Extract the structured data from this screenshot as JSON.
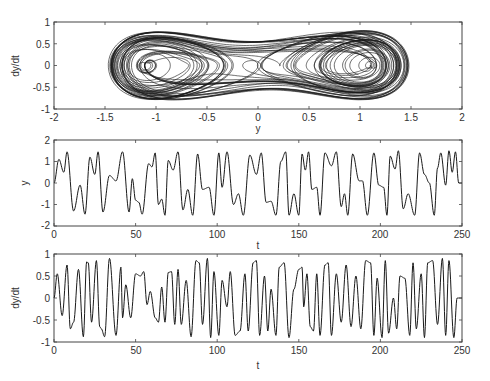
{
  "chart_data": [
    {
      "type": "line",
      "subtype": "phase-portrait",
      "title": "",
      "xlabel": "y",
      "ylabel": "dy/dt",
      "xlim": [
        -2,
        2
      ],
      "ylim": [
        -1,
        1
      ],
      "xticks": [
        -2,
        -1.5,
        -1,
        -0.5,
        0,
        0.5,
        1,
        1.5,
        2
      ],
      "yticks": [
        -1,
        -0.5,
        0,
        0.5,
        1
      ],
      "xtick_labels": [
        "-2",
        "-1.5",
        "-1",
        "-0.5",
        "0",
        "0.5",
        "1",
        "1.5",
        "2"
      ],
      "ytick_labels": [
        "-1",
        "-0.5",
        "0",
        "0.5",
        "1"
      ],
      "grid": false,
      "description": "Chaotic double-well attractor: trajectory of (y, dy/dt) orbiting two foci near y=-0.85 and y=0.85, outer envelope reaching y=±1.5, dy/dt within about ±0.9",
      "foci": [
        [
          -0.85,
          0.0
        ],
        [
          0.85,
          0.0
        ]
      ],
      "envelope": {
        "y_range": [
          -1.5,
          1.5
        ],
        "dydt_range": [
          -0.92,
          0.92
        ]
      }
    },
    {
      "type": "line",
      "title": "",
      "xlabel": "t",
      "ylabel": "y",
      "xlim": [
        0,
        250
      ],
      "ylim": [
        -2,
        2
      ],
      "xticks": [
        0,
        50,
        100,
        150,
        200,
        250
      ],
      "yticks": [
        -2,
        -1,
        0,
        1,
        2
      ],
      "xtick_labels": [
        "0",
        "50",
        "100",
        "150",
        "200",
        "250"
      ],
      "ytick_labels": [
        "-2",
        "-1",
        "0",
        "1",
        "2"
      ],
      "grid": false,
      "series": [
        {
          "name": "y(t)",
          "extrema_t": [
            0,
            3,
            6,
            8,
            12,
            16,
            19,
            22,
            25,
            27,
            30,
            34,
            38,
            42,
            46,
            48,
            50,
            52,
            54,
            58,
            60,
            62,
            64,
            66,
            68,
            70,
            73,
            76,
            79,
            82,
            85,
            88,
            91,
            95,
            98,
            101,
            103,
            106,
            110,
            113,
            116,
            120,
            124,
            127,
            130,
            133,
            136,
            139,
            142,
            144,
            147,
            150,
            152,
            154,
            156,
            158,
            161,
            163,
            166,
            170,
            173,
            176,
            178,
            180,
            183,
            187,
            189,
            192,
            196,
            199,
            202,
            204,
            206,
            209,
            211,
            214,
            217,
            221,
            224,
            227,
            230,
            233,
            235,
            237,
            240,
            242,
            244,
            246,
            248,
            250
          ],
          "extrema_y": [
            0.0,
            1.1,
            0.5,
            1.45,
            -1.3,
            -0.1,
            -1.45,
            1.2,
            0.4,
            1.45,
            -1.35,
            0.35,
            0.1,
            1.45,
            -1.35,
            0.2,
            -0.8,
            -0.9,
            -1.45,
            0.9,
            0.75,
            1.4,
            -1.0,
            -0.75,
            -1.5,
            1.05,
            0.6,
            1.45,
            -1.25,
            -0.3,
            -1.5,
            1.35,
            -0.3,
            -0.2,
            -1.5,
            1.4,
            -0.2,
            1.45,
            -1.0,
            -0.5,
            -1.5,
            1.3,
            0.4,
            1.4,
            -0.9,
            -0.85,
            -1.5,
            1.0,
            1.45,
            -1.5,
            -0.5,
            -1.5,
            1.35,
            0.6,
            1.45,
            -0.3,
            -0.2,
            -1.5,
            1.4,
            0.8,
            1.45,
            -1.1,
            -0.5,
            -1.5,
            1.35,
            0.1,
            0.1,
            -1.5,
            1.4,
            -0.1,
            -0.2,
            -1.5,
            1.25,
            0.65,
            1.5,
            -1.2,
            -0.5,
            -1.5,
            1.4,
            0.4,
            0.0,
            -1.5,
            0.7,
            1.4,
            -0.1,
            1.5,
            0.5,
            1.45,
            0.0,
            0.0
          ]
        }
      ]
    },
    {
      "type": "line",
      "title": "",
      "xlabel": "t",
      "ylabel": "dy/dt",
      "xlim": [
        0,
        250
      ],
      "ylim": [
        -1,
        1
      ],
      "xticks": [
        0,
        50,
        100,
        150,
        200,
        250
      ],
      "yticks": [
        -1,
        -0.5,
        0,
        0.5,
        1
      ],
      "xtick_labels": [
        "0",
        "50",
        "100",
        "150",
        "200",
        "250"
      ],
      "ytick_labels": [
        "-1",
        "-0.5",
        "0",
        "0.5",
        "1"
      ],
      "grid": false,
      "series": [
        {
          "name": "dy/dt(t)",
          "extrema_t": [
            0,
            2,
            5,
            8,
            10,
            12,
            15,
            18,
            20,
            21,
            23,
            26,
            28,
            29,
            31,
            34,
            38,
            41,
            42,
            44,
            47,
            50,
            53,
            55,
            57,
            59,
            62,
            64,
            66,
            68,
            70,
            72,
            74,
            76,
            78,
            81,
            84,
            87,
            89,
            91,
            94,
            96,
            98,
            101,
            103,
            106,
            108,
            111,
            114,
            117,
            119,
            122,
            124,
            126,
            129,
            131,
            133,
            136,
            138,
            141,
            144,
            147,
            150,
            152,
            153,
            155,
            157,
            159,
            161,
            163,
            166,
            168,
            170,
            173,
            176,
            179,
            182,
            185,
            188,
            191,
            194,
            196,
            198,
            201,
            203,
            205,
            208,
            210,
            212,
            215,
            218,
            220,
            222,
            225,
            227,
            229,
            232,
            235,
            238,
            240,
            242,
            245,
            247,
            249,
            250
          ],
          "extrema_y": [
            0.0,
            0.55,
            -0.4,
            0.75,
            -0.7,
            -0.55,
            0.65,
            -0.88,
            0.82,
            0.8,
            -0.55,
            0.85,
            -0.65,
            -0.7,
            -0.88,
            0.9,
            -0.85,
            0.7,
            -0.45,
            0.3,
            -0.45,
            0.55,
            0.5,
            0.6,
            -0.15,
            0.15,
            -0.45,
            -0.55,
            0.25,
            -0.55,
            0.58,
            0.6,
            -0.6,
            0.65,
            -0.6,
            0.4,
            -0.88,
            0.85,
            0.8,
            -0.6,
            0.9,
            -0.9,
            0.6,
            -0.85,
            0.4,
            -0.2,
            0.6,
            -0.85,
            -0.75,
            0.55,
            -0.75,
            0.8,
            0.85,
            -0.85,
            0.5,
            -0.75,
            0.2,
            -0.85,
            0.7,
            0.8,
            -0.9,
            0.2,
            0.65,
            0.7,
            -0.2,
            0.55,
            -0.65,
            -0.75,
            0.55,
            -0.85,
            0.75,
            0.8,
            -0.85,
            0.55,
            -0.55,
            0.75,
            -0.65,
            0.5,
            -0.7,
            0.85,
            0.8,
            -0.85,
            0.45,
            -0.9,
            0.85,
            -0.8,
            0.0,
            -0.7,
            0.5,
            0.45,
            -0.85,
            0.8,
            -0.7,
            0.55,
            -0.9,
            0.8,
            0.85,
            -0.6,
            0.9,
            -0.85,
            0.85,
            -0.9,
            0.0,
            0.0,
            0.0
          ]
        }
      ]
    }
  ],
  "plots": {
    "top": {
      "xlabel": "y",
      "ylabel": "dy/dt",
      "xtick_labels": [
        "-2",
        "-1.5",
        "-1",
        "-0.5",
        "0",
        "0.5",
        "1",
        "1.5",
        "2"
      ],
      "ytick_labels": [
        "1",
        "0.5",
        "0",
        "-0.5",
        "-1"
      ]
    },
    "middle": {
      "xlabel": "t",
      "ylabel": "y",
      "xtick_labels": [
        "0",
        "50",
        "100",
        "150",
        "200",
        "250"
      ],
      "ytick_labels": [
        "2",
        "1",
        "0",
        "-1",
        "-2"
      ]
    },
    "bottom": {
      "xlabel": "t",
      "ylabel": "dy/dt",
      "xtick_labels": [
        "0",
        "50",
        "100",
        "150",
        "200",
        "250"
      ],
      "ytick_labels": [
        "1",
        "0.5",
        "0",
        "-0.5",
        "-1"
      ]
    }
  },
  "colors": {
    "line": "#1a1a1a",
    "axes": "#444444",
    "accent_red": "#d9534f",
    "accent_green": "#5cb85c",
    "accent_blue": "#5bc0de"
  }
}
